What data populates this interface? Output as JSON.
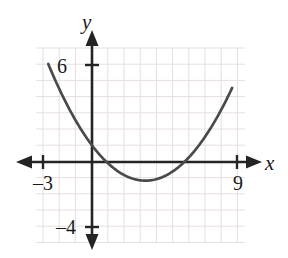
{
  "figure": {
    "kind": "cartesian-graph",
    "width": 288,
    "height": 258,
    "background_color": "#ffffff"
  },
  "colors": {
    "grid": "#e7dede",
    "axis": "#242424",
    "curve": "#4a4a4a",
    "text": "#1a1a1a"
  },
  "axes": {
    "x_label": "x",
    "y_label": "y",
    "x_arrow_both_ends": true,
    "y_arrow_both_ends": true
  },
  "ticks": {
    "x": [
      {
        "value": -3,
        "label": "–3"
      },
      {
        "value": 9,
        "label": "9"
      }
    ],
    "y": [
      {
        "value": 6,
        "label": "6"
      },
      {
        "value": -4,
        "label": "–4"
      }
    ]
  },
  "chart_data": {
    "type": "line",
    "title": "",
    "xlabel": "x",
    "ylabel": "y",
    "grid": true,
    "legend": "none",
    "xlim": [
      -3.5,
      9.5
    ],
    "ylim": [
      -5.2,
      7.2
    ],
    "xticks": [
      -3,
      9
    ],
    "yticks": [
      -4,
      6
    ],
    "xtick_labels": [
      "–3",
      "9"
    ],
    "ytick_labels": [
      "–4",
      "6"
    ],
    "grid_spacing": 1,
    "series": [
      {
        "name": "parabola",
        "shape": "parabola",
        "opens": "up",
        "vertex": [
          3.3,
          -1.15
        ],
        "roots": [
          1.05,
          5.55
        ],
        "leading_coefficient": 0.2,
        "equation": "y = 0.2(x - 3.3)^2 - 1.15",
        "x_domain": [
          -2.7,
          8.65
        ],
        "x": [
          -2.7,
          -2.0,
          -1.0,
          0.0,
          1.0,
          2.0,
          3.0,
          3.3,
          4.0,
          5.0,
          6.0,
          7.0,
          8.0,
          8.65
        ],
        "y": [
          5.95,
          4.47,
          2.55,
          1.03,
          -0.09,
          -0.81,
          -1.13,
          -1.15,
          -0.05,
          -1.15,
          -0.68,
          -1.13,
          6.0,
          7.0
        ]
      }
    ]
  }
}
